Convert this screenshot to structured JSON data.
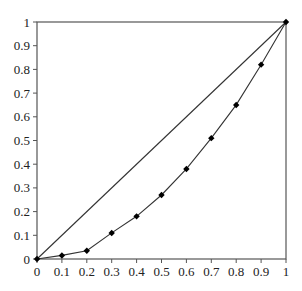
{
  "chart_data": {
    "type": "line",
    "title": "",
    "xlabel": "",
    "ylabel": "",
    "xlim": [
      0,
      1
    ],
    "ylim": [
      0,
      1
    ],
    "grid": false,
    "legend": null,
    "x_ticks": [
      "0",
      "0.1",
      "0.2",
      "0.3",
      "0.4",
      "0.5",
      "0.6",
      "0.7",
      "0.8",
      "0.9",
      "1"
    ],
    "y_ticks": [
      "0",
      "0.1",
      "0.2",
      "0.3",
      "0.4",
      "0.5",
      "0.6",
      "0.7",
      "0.8",
      "0.9",
      "1"
    ],
    "series": [
      {
        "name": "Line of equality",
        "style": "line",
        "x": [
          0,
          1
        ],
        "y": [
          0,
          1
        ]
      },
      {
        "name": "Lorenz curve",
        "style": "line-with-diamond-markers",
        "x": [
          0,
          0.1,
          0.2,
          0.3,
          0.4,
          0.5,
          0.6,
          0.7,
          0.8,
          0.9,
          1
        ],
        "y": [
          0,
          0.015,
          0.035,
          0.11,
          0.18,
          0.27,
          0.38,
          0.51,
          0.65,
          0.82,
          1
        ]
      }
    ]
  },
  "colors": {
    "axis": "#555555",
    "line": "#333333",
    "marker": "#000000"
  }
}
